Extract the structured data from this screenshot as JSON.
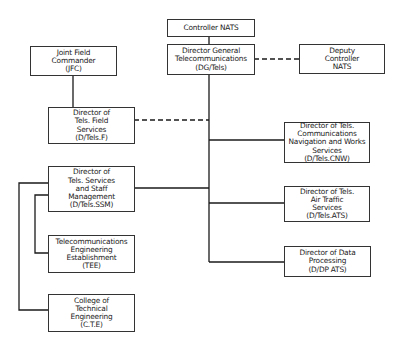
{
  "nodes": {
    "controller": {
      "lines": [
        "Controller NATS"
      ]
    },
    "dg": {
      "lines": [
        "Director General",
        "Telecommunications",
        "(DG/Tels)"
      ]
    },
    "deputy": {
      "lines": [
        "Deputy",
        "Controller",
        "NATS"
      ]
    },
    "jfc": {
      "lines": [
        "Joint Field",
        "Commander",
        "(JFC)"
      ]
    },
    "field": {
      "lines": [
        "Director of",
        "Tels. Field",
        "Services",
        "(D/Tels.F)"
      ]
    },
    "ssm": {
      "lines": [
        "Director of",
        "Tels. Services",
        "and Staff",
        "Management",
        "(D/Tels.SSM)"
      ]
    },
    "cnw": {
      "lines": [
        "Director of Tels.",
        "Communications",
        "Navigation and Works",
        "Services",
        "(D/Tels.CNW)"
      ]
    },
    "ats": {
      "lines": [
        "Director of Tels.",
        "Air Traffic",
        "Services",
        "(D/Tels.ATS)"
      ]
    },
    "dp": {
      "lines": [
        "Director of Data",
        "Processing",
        "(D/DP ATS)"
      ]
    },
    "tee": {
      "lines": [
        "Telecommunications",
        "Engineering",
        "Establishment",
        "(TEE)"
      ]
    },
    "cte": {
      "lines": [
        "College of",
        "Technical",
        "Engineering",
        "(C.T.E)"
      ]
    }
  },
  "connections": [
    {
      "from": "controller",
      "to": "dg",
      "style": "solid"
    },
    {
      "from": "dg",
      "to": "deputy",
      "style": "dashed"
    },
    {
      "from": "jfc",
      "to": "field",
      "style": "solid"
    },
    {
      "from": "dg",
      "to": "field",
      "style": "dashed"
    },
    {
      "from": "dg",
      "to": "ssm",
      "style": "solid"
    },
    {
      "from": "dg",
      "to": "cnw",
      "style": "solid"
    },
    {
      "from": "dg",
      "to": "ats",
      "style": "solid"
    },
    {
      "from": "dg",
      "to": "dp",
      "style": "solid"
    },
    {
      "from": "ssm",
      "to": "tee",
      "style": "solid"
    },
    {
      "from": "ssm",
      "to": "cte",
      "style": "solid"
    }
  ]
}
